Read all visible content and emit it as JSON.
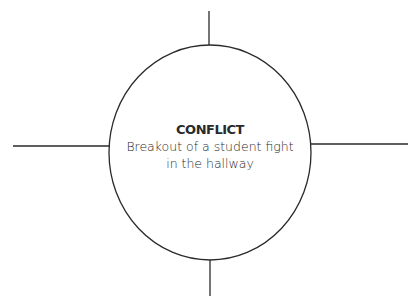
{
  "diagram": {
    "center": {
      "title": "CONFLICT",
      "description_line1": "Breakout of a student fight",
      "description_line2": "in the hallway"
    },
    "spokes": [
      "top",
      "right",
      "bottom",
      "left"
    ],
    "colors": {
      "stroke": "#2a2a2a",
      "background": "#ffffff"
    }
  }
}
